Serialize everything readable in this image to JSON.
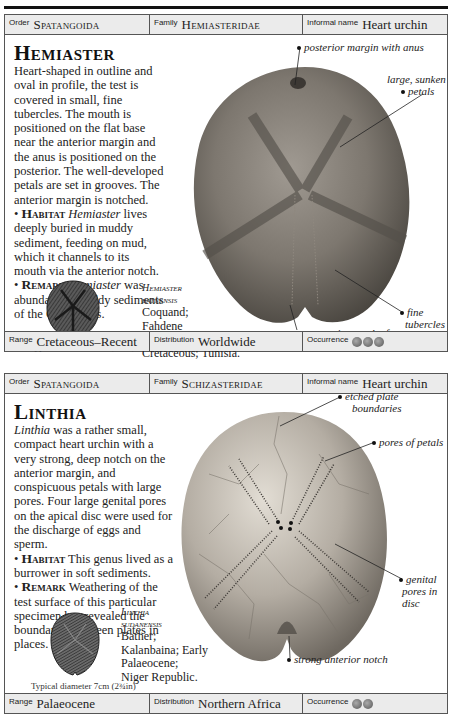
{
  "entries": [
    {
      "header": {
        "order_label": "Order",
        "order": "Spatangoida",
        "family_label": "Family",
        "family": "Hemiasteridae",
        "informal_label": "Informal name",
        "informal": "Heart urchin"
      },
      "title": "Hemiaster",
      "description": "Heart-shaped in outline and oval in profile, the test is covered in small, fine tubercles. The mouth is positioned on the flat base near the anterior margin and the anus is positioned on the posterior. The well-developed petals are set in grooves. The anterior margin is notched.",
      "habitat_label": "Habitat",
      "habitat_genus": "Hemiaster",
      "habitat": "lives deeply buried in muddy sediment, feeding on mud, which it channels to its mouth via the anterior notch.",
      "remark_label": "Remark",
      "remark_genus": "Hemiaster",
      "remark": "was abundant in muddy sediments of the Cretaceous.",
      "specimen": {
        "name_line1": "Hemiaster",
        "name_line2": "batnensis",
        "details": [
          "Coquand;",
          "Fahdene",
          "Formation; Late",
          "Cretaceous; Tunisia."
        ]
      },
      "thumbnail_caption": "Typical diameter 4cm (1½in)",
      "annotations": [
        {
          "label": "posterior margin with anus"
        },
        {
          "label": "large, sunken"
        },
        {
          "label": "petals"
        },
        {
          "label": "fine"
        },
        {
          "label": "tubercles"
        },
        {
          "label": "anterior notch of test"
        }
      ],
      "footer": {
        "range_label": "Range",
        "range": "Cretaceous–Recent",
        "distribution_label": "Distribution",
        "distribution": "Worldwide",
        "occurrence_label": "Occurrence",
        "occurrence_count": 3
      }
    },
    {
      "header": {
        "order_label": "Order",
        "order": "Spatangoida",
        "family_label": "Family",
        "family": "Schizasteridae",
        "informal_label": "Informal name",
        "informal": "Heart urchin"
      },
      "title": "Linthia",
      "description_genus": "Linthia",
      "description": "was a rather small, compact heart urchin with a very strong, deep notch on the anterior margin, and conspicuous petals with large pores. Four large genital pores on the apical disc were used for the discharge of eggs and sperm.",
      "habitat_label": "Habitat",
      "habitat": "This genus lived as a burrower in soft sediments.",
      "remark_label": "Remark",
      "remark": "Weathering of the test surface of this particular specimen has revealed the boundaries between plates in places.",
      "specimen": {
        "name_line1": "Linthia",
        "name_line2": "sudanensis",
        "details": [
          "Bather;",
          "Kalanbaina; Early",
          "Palaeocene;",
          "Niger Republic."
        ]
      },
      "thumbnail_caption": "Typical diameter 7cm (2¾in)",
      "annotations": [
        {
          "label": "etched plate"
        },
        {
          "label": "boundaries"
        },
        {
          "label": "pores of petals"
        },
        {
          "label": "genital"
        },
        {
          "label": "pores in"
        },
        {
          "label": "disc"
        },
        {
          "label": "strong anterior notch"
        }
      ],
      "footer": {
        "range_label": "Range",
        "range": "Palaeocene",
        "distribution_label": "Distribution",
        "distribution": "Northern Africa",
        "occurrence_label": "Occurrence",
        "occurrence_count": 2
      }
    }
  ]
}
